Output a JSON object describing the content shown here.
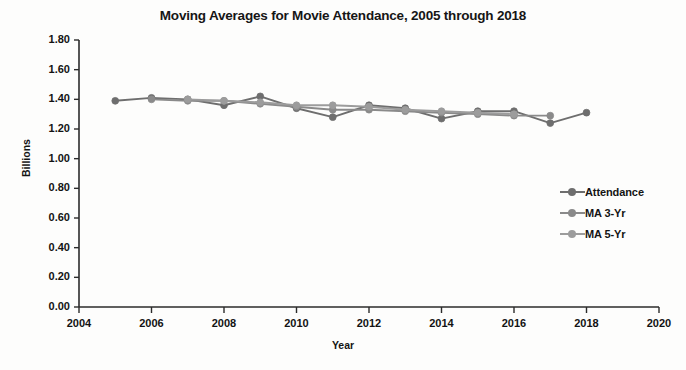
{
  "chart_data": {
    "type": "line",
    "title": "Moving Averages for Movie Attendance, 2005 through 2018",
    "xlabel": "Year",
    "ylabel": "Billions",
    "xlim": [
      2004,
      2020
    ],
    "ylim": [
      0.0,
      1.8
    ],
    "grid": false,
    "legend_position": "right",
    "xticks": [
      "2004",
      "2006",
      "2008",
      "2010",
      "2012",
      "2014",
      "2016",
      "2018",
      "2020"
    ],
    "xtick_values": [
      2004,
      2006,
      2008,
      2010,
      2012,
      2014,
      2016,
      2018,
      2020
    ],
    "yticks": [
      "0.00",
      "0.20",
      "0.40",
      "0.60",
      "0.80",
      "1.00",
      "1.20",
      "1.40",
      "1.60",
      "1.80"
    ],
    "ytick_values": [
      0.0,
      0.2,
      0.4,
      0.6,
      0.8,
      1.0,
      1.2,
      1.4,
      1.6,
      1.8
    ],
    "x": [
      2005,
      2006,
      2007,
      2008,
      2009,
      2010,
      2011,
      2012,
      2013,
      2014,
      2015,
      2016,
      2017,
      2018
    ],
    "series": [
      {
        "name": "Attendance",
        "color": "#6e6e6e",
        "x": [
          2005,
          2006,
          2007,
          2008,
          2009,
          2010,
          2011,
          2012,
          2013,
          2014,
          2015,
          2016,
          2017,
          2018
        ],
        "values": [
          1.39,
          1.41,
          1.4,
          1.36,
          1.42,
          1.34,
          1.28,
          1.36,
          1.34,
          1.27,
          1.32,
          1.32,
          1.24,
          1.31
        ]
      },
      {
        "name": "MA 3-Yr",
        "color": "#8a8a8a",
        "x": [
          2006,
          2007,
          2008,
          2009,
          2010,
          2011,
          2012,
          2013,
          2014,
          2015,
          2016,
          2017
        ],
        "values": [
          1.4,
          1.39,
          1.39,
          1.37,
          1.35,
          1.33,
          1.33,
          1.32,
          1.31,
          1.3,
          1.29,
          1.29
        ]
      },
      {
        "name": "MA 5-Yr",
        "color": "#9c9c9c",
        "x": [
          2007,
          2008,
          2009,
          2010,
          2011,
          2012,
          2013,
          2014,
          2015,
          2016
        ],
        "values": [
          1.4,
          1.39,
          1.38,
          1.36,
          1.36,
          1.35,
          1.33,
          1.32,
          1.31,
          1.3
        ]
      }
    ]
  },
  "legend": {
    "items": [
      {
        "label": "Attendance"
      },
      {
        "label": "MA 3-Yr"
      },
      {
        "label": "MA 5-Yr"
      }
    ]
  },
  "axis_color": "#2b2b2b"
}
